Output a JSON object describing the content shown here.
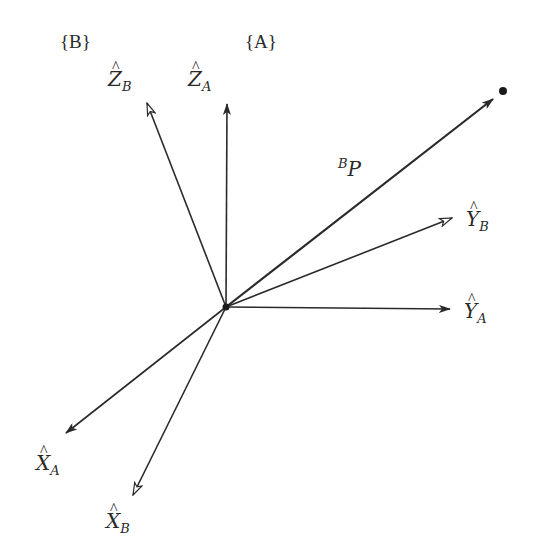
{
  "diagram": {
    "frames": [
      {
        "id": "B",
        "label": "{B}",
        "x": 60,
        "y": 48
      },
      {
        "id": "A",
        "label": "{A}",
        "x": 245,
        "y": 48
      }
    ],
    "origin": {
      "x": 226,
      "y": 307
    },
    "axes": [
      {
        "id": "Z_A",
        "letter": "Z",
        "sub": "A",
        "tip": [
          227,
          104
        ],
        "head": "filled",
        "label_pos": [
          176,
          90
        ]
      },
      {
        "id": "Z_B",
        "letter": "Z",
        "sub": "B",
        "tip": [
          147,
          103
        ],
        "head": "open",
        "label_pos": [
          108,
          86
        ]
      },
      {
        "id": "Y_B",
        "letter": "Y",
        "sub": "B",
        "tip": [
          452,
          218
        ],
        "head": "open",
        "label_pos": [
          466,
          225
        ]
      },
      {
        "id": "Y_A",
        "letter": "Y",
        "sub": "A",
        "tip": [
          450,
          309
        ],
        "head": "filled",
        "label_pos": [
          464,
          316
        ]
      },
      {
        "id": "X_A",
        "letter": "X",
        "sub": "A",
        "tip": [
          66,
          433
        ],
        "head": "filled",
        "label_pos": [
          36,
          466
        ]
      },
      {
        "id": "X_B",
        "letter": "X",
        "sub": "B",
        "tip": [
          133,
          495
        ],
        "head": "open",
        "label_pos": [
          106,
          525
        ]
      }
    ],
    "vector": {
      "id": "BP",
      "pre_sup": "B",
      "letter": "P",
      "tip": [
        493,
        99
      ],
      "label_pos": [
        350,
        172
      ]
    },
    "point": {
      "x": 503,
      "y": 91
    }
  }
}
